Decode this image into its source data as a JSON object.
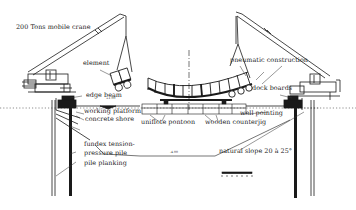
{
  "diagram": {
    "colors": {
      "ink": "#1a1a1a",
      "light_ink": "#666666",
      "background": "#ffffff"
    },
    "labels": {
      "crane": "200 Tons mobile crane",
      "element": "element",
      "edge_beam": "edge beam",
      "working_platform": "working platform",
      "concrete_shore": "concrete shore",
      "unifiote_pontoon": "uniflote pontoon",
      "wooden_counterjig": "wooden counterjig",
      "well_pointing": "well pointing",
      "pneumatic_construction": "pneumatic construction",
      "dock_boards": "dock boards",
      "fundex_pile_line1": "fundex tension-",
      "fundex_pile_line2": "pressure pile",
      "pile_planking": "pile planking",
      "natural_slope": "natural slope 20 à 25°"
    },
    "level_marks": {
      "upper": "+1.00",
      "lower": "-4.00"
    },
    "icons": [
      "mobile-crane-left",
      "mobile-crane-right",
      "scale-bar",
      "centerline"
    ]
  }
}
